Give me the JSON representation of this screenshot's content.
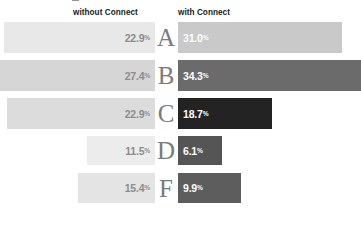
{
  "header": {
    "left_label": "without Connect",
    "right_label": "with Connect"
  },
  "chart_data": {
    "type": "bar",
    "title": "",
    "xlabel": "",
    "ylabel": "",
    "orientation": "horizontal-diverging",
    "categories": [
      "A",
      "B",
      "C",
      "D",
      "F"
    ],
    "series": [
      {
        "name": "without Connect",
        "values": [
          22.9,
          27.4,
          22.9,
          11.5,
          15.4
        ],
        "labels": [
          "22.9%",
          "27.4%",
          "22.9%",
          "11.5%",
          "15.4%"
        ],
        "side": "left"
      },
      {
        "name": "with Connect",
        "values": [
          31.0,
          34.3,
          18.7,
          6.1,
          9.9
        ],
        "labels": [
          "31.0%",
          "34.3%",
          "18.7%",
          "6.1%",
          "9.9%"
        ],
        "side": "right"
      }
    ],
    "legend_position": "top",
    "grid": false
  },
  "rows": [
    {
      "letter": "A",
      "left": {
        "value": "22.9",
        "pct": "%",
        "width": 151,
        "color": "#e8e8e8"
      },
      "right": {
        "value": "31.0",
        "pct": "%",
        "width": 164,
        "color": "#c9c9c9"
      }
    },
    {
      "letter": "B",
      "left": {
        "value": "27.4",
        "pct": "%",
        "width": 156,
        "color": "#d6d6d6"
      },
      "right": {
        "value": "34.3",
        "pct": "%",
        "width": 183,
        "color": "#6b6b6b"
      }
    },
    {
      "letter": "C",
      "left": {
        "value": "22.9",
        "pct": "%",
        "width": 148,
        "color": "#dcdcdc"
      },
      "right": {
        "value": "18.7",
        "pct": "%",
        "width": 94,
        "color": "#232323"
      }
    },
    {
      "letter": "D",
      "left": {
        "value": "11.5",
        "pct": "%",
        "width": 68,
        "color": "#ececec"
      },
      "right": {
        "value": "6.1",
        "pct": "%",
        "width": 44,
        "color": "#555555"
      }
    },
    {
      "letter": "F",
      "left": {
        "value": "15.4",
        "pct": "%",
        "width": 77,
        "color": "#e4e4e4"
      },
      "right": {
        "value": "9.9",
        "pct": "%",
        "width": 63,
        "color": "#5d5d5d"
      }
    }
  ],
  "colors": {
    "left_label_text": "#8c8c8c",
    "right_label_text": "#ffffff",
    "letter_text": "#7b7b7b",
    "header_text": "#1a1a1a",
    "background": "#ffffff"
  }
}
